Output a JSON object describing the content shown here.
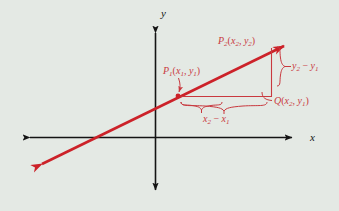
{
  "figure": {
    "background_color": "#e4e9e4",
    "line_color": "#cc2229",
    "annotation_color": "#c9393f",
    "axis_color": "#141414"
  },
  "axes": {
    "x_label": "x",
    "y_label": "y",
    "x_axis": {
      "y": 137,
      "x_start": 25,
      "x_end": 297
    },
    "y_axis": {
      "x": 155,
      "y_start": 28,
      "y_end": 195
    }
  },
  "line": {
    "name": "secant-line",
    "from": {
      "x": 36,
      "y": 167
    },
    "to": {
      "x": 290,
      "y": 43
    },
    "double_arrow": true
  },
  "points": [
    {
      "id": "P1",
      "label": "P",
      "sub": "1",
      "args_x": "x",
      "args_x_sub": "1",
      "args_y": "y",
      "args_y_sub": "1",
      "full_label": "P₁(x₁, y₁)",
      "dot": {
        "x": 178,
        "y": 96
      }
    },
    {
      "id": "P2",
      "label": "P",
      "sub": "2",
      "args_x": "x",
      "args_x_sub": "2",
      "args_y": "y",
      "args_y_sub": "2",
      "full_label": "P₂(x₂, y₂)",
      "dot": {
        "x": 271,
        "y": 50
      }
    },
    {
      "id": "Q",
      "label": "Q",
      "sub": "",
      "args_x": "x",
      "args_x_sub": "2",
      "args_y": "y",
      "args_y_sub": "1",
      "full_label": "Q(x₂, y₁)",
      "dot": {
        "x": 271,
        "y": 96
      }
    }
  ],
  "deltas": {
    "rise": {
      "label": "y",
      "sub1": "2",
      "minus": "−",
      "label2": "y",
      "sub2": "1",
      "full": "y₂ − y₁"
    },
    "run": {
      "label": "x",
      "sub1": "2",
      "minus": "−",
      "label2": "x",
      "sub2": "1",
      "full": "x₂ − x₁"
    }
  }
}
